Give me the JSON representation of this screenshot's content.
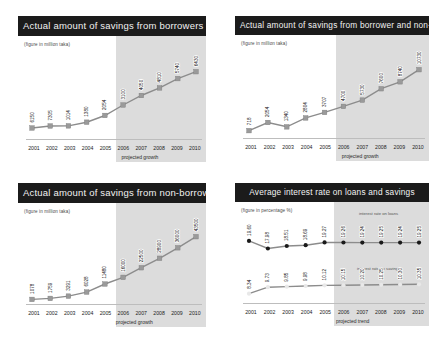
{
  "page": {
    "background": "#ffffff",
    "panel_count": 4
  },
  "style": {
    "title_bg": "#1b1b1b",
    "title_fg": "#f2f2f2",
    "band_color": "#d6d6d6",
    "series_line": "#8c8c8c",
    "marker_fill": "#9a9a9a",
    "dark_marker": "#1a1a1a"
  },
  "common": {
    "years": [
      "2001",
      "2002",
      "2003",
      "2004",
      "2005",
      "2006",
      "2007",
      "2008",
      "2009",
      "2010"
    ],
    "subtitle_taka": "(figure in million taka)",
    "subtitle_pct": "(figure in percentage %)",
    "projected_growth": "projected growth",
    "projected_trend": "projected trend"
  },
  "chart_data": [
    {
      "type": "line",
      "panel": "top-left",
      "title": "Actual amount of savings from borrowers",
      "subtitle": "(figure in million taka)",
      "xlabel": "projected growth",
      "ylabel": "",
      "categories": [
        "2001",
        "2002",
        "2003",
        "2004",
        "2005",
        "2006",
        "2007",
        "2008",
        "2009",
        "2010"
      ],
      "values": [
        6150,
        7305,
        1014,
        1380,
        2054,
        3100,
        4050,
        4810,
        5740,
        6430
      ],
      "labels": [
        "6150",
        "7305",
        "1014",
        "1380",
        "2054",
        "3100",
        "4050",
        "4810",
        "5740",
        "6430"
      ],
      "ylim": [
        0,
        7000
      ],
      "grid": false,
      "legend": "",
      "projected_from": "2006",
      "projected_note": "projected growth"
    },
    {
      "type": "line",
      "panel": "top-right",
      "title": "Actual amount of  savings from borrower and non-borrowers",
      "subtitle": "(figure in million taka)",
      "xlabel": "projected growth",
      "ylabel": "",
      "categories": [
        "2001",
        "2002",
        "2003",
        "2004",
        "2005",
        "2006",
        "2007",
        "2008",
        "2009",
        "2010"
      ],
      "values": [
        718,
        2054,
        1340,
        2804,
        3707,
        4700,
        5730,
        7600,
        8740,
        10730
      ],
      "labels": [
        "718",
        "2054",
        "1340",
        "2804",
        "3707",
        "4700",
        "5730",
        "7600",
        "8740",
        "10730"
      ],
      "ylim": [
        0,
        11000
      ],
      "grid": false,
      "legend": "",
      "projected_from": "2006",
      "projected_note": "projected growth"
    },
    {
      "type": "line",
      "panel": "bottom-left",
      "title": "Actual amount of savings from non-borrowers",
      "subtitle": "(figure in million taka)",
      "xlabel": "projected growth",
      "ylabel": "",
      "categories": [
        "2001",
        "2002",
        "2003",
        "2004",
        "2005",
        "2006",
        "2007",
        "2008",
        "2009",
        "2010"
      ],
      "values": [
        1078,
        1759,
        3291,
        6028,
        11480,
        16000,
        22500,
        28900,
        36000,
        43500
      ],
      "labels": [
        "1078",
        "1759",
        "3291",
        "6028",
        "11480",
        "16000",
        "22500",
        "28900",
        "36000",
        "43500"
      ],
      "ylim": [
        0,
        45000
      ],
      "grid": false,
      "legend": "",
      "projected_from": "2006",
      "projected_note": "projected growth"
    },
    {
      "type": "line",
      "panel": "bottom-right",
      "title": "Average interest rate on  loans  and savings",
      "subtitle": "(figure in percentage %)",
      "xlabel": "projected trend",
      "ylabel": "",
      "categories": [
        "2001",
        "2002",
        "2003",
        "2004",
        "2005",
        "2006",
        "2007",
        "2008",
        "2009",
        "2010"
      ],
      "series": [
        {
          "name": "interest rate on loans",
          "values": [
            19.6,
            17.98,
            18.51,
            18.69,
            19.27,
            19.26,
            19.24,
            19.25,
            19.24,
            19.25
          ],
          "labels": [
            "19.60",
            "17.98",
            "18.51",
            "18.69",
            "19.27",
            "19.26",
            "19.24",
            "19.25",
            "19.24",
            "19.25"
          ]
        },
        {
          "name": "interest rate on savings",
          "values": [
            8.34,
            9.73,
            9.85,
            9.98,
            10.12,
            10.15,
            10.2,
            10.25,
            10.3,
            10.35
          ],
          "labels": [
            "8.34",
            "9.73",
            "9.85",
            "9.98",
            "10.12",
            "10.15",
            "10.20",
            "10.25",
            "10.30",
            "10.35"
          ]
        }
      ],
      "ylim": [
        7,
        21
      ],
      "grid": false,
      "legend_position": "inline-right",
      "projected_from": "2006",
      "projected_note": "projected trend"
    }
  ]
}
